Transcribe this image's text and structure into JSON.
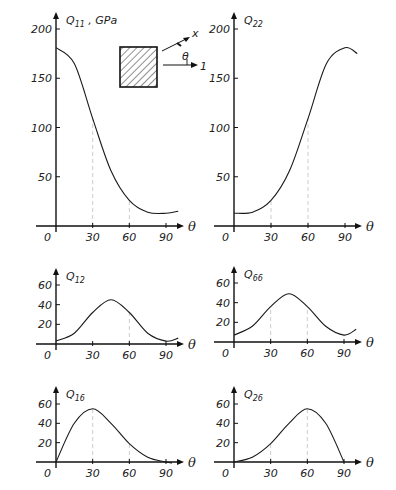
{
  "figure": {
    "inset": {
      "x_axis_label": "x",
      "angle_label": "θ",
      "ref_axis_label": "1"
    }
  },
  "chart_data": [
    {
      "type": "line",
      "id": "q11",
      "title": "Q11 , GPa",
      "title_main": "Q",
      "title_sub": "11",
      "title_suffix": " , GPa",
      "xlabel": "θ",
      "ylabel": "GPa",
      "x": [
        0,
        15,
        30,
        45,
        60,
        75,
        90,
        100
      ],
      "values": [
        181,
        165,
        109,
        56,
        26,
        14,
        13,
        15
      ],
      "xticks": [
        0,
        30,
        60,
        90
      ],
      "yticks": [
        50,
        100,
        150,
        200
      ],
      "xlim": [
        0,
        100
      ],
      "ylim": [
        0,
        210
      ],
      "guides": [
        [
          30,
          109
        ],
        [
          60,
          26
        ]
      ]
    },
    {
      "type": "line",
      "id": "q22",
      "title": "Q22",
      "title_main": "Q",
      "title_sub": "22",
      "title_suffix": "",
      "xlabel": "θ",
      "ylabel": "",
      "x": [
        0,
        15,
        30,
        45,
        60,
        75,
        90,
        100
      ],
      "values": [
        13,
        14,
        26,
        56,
        109,
        165,
        181,
        175
      ],
      "xticks": [
        0,
        30,
        60,
        90
      ],
      "yticks": [
        50,
        100,
        150,
        200
      ],
      "xlim": [
        0,
        100
      ],
      "ylim": [
        0,
        210
      ],
      "guides": [
        [
          30,
          26
        ],
        [
          60,
          109
        ]
      ]
    },
    {
      "type": "line",
      "id": "q12",
      "title": "Q12",
      "title_main": "Q",
      "title_sub": "12",
      "title_suffix": "",
      "xlabel": "θ",
      "ylabel": "",
      "x": [
        0,
        15,
        30,
        45,
        60,
        75,
        90,
        100
      ],
      "values": [
        3,
        11,
        32,
        45,
        32,
        11,
        3,
        6
      ],
      "xticks": [
        0,
        30,
        60,
        90
      ],
      "yticks": [
        20,
        40,
        60
      ],
      "xlim": [
        0,
        100
      ],
      "ylim": [
        0,
        72
      ],
      "guides": [
        [
          60,
          32
        ]
      ]
    },
    {
      "type": "line",
      "id": "q66",
      "title": "Q66",
      "title_main": "Q",
      "title_sub": "66",
      "title_suffix": "",
      "xlabel": "θ",
      "ylabel": "",
      "x": [
        0,
        15,
        30,
        45,
        60,
        75,
        90,
        100
      ],
      "values": [
        7,
        16,
        36,
        49,
        36,
        16,
        7,
        13
      ],
      "xticks": [
        0,
        30,
        60,
        90
      ],
      "yticks": [
        20,
        40,
        60
      ],
      "xlim": [
        0,
        100
      ],
      "ylim": [
        0,
        72
      ],
      "guides": [
        [
          30,
          36
        ],
        [
          60,
          36
        ]
      ]
    },
    {
      "type": "line",
      "id": "q16",
      "title": "Q16",
      "title_main": "Q",
      "title_sub": "16",
      "title_suffix": "",
      "xlabel": "θ",
      "ylabel": "",
      "x": [
        0,
        15,
        30,
        45,
        60,
        75,
        90,
        95
      ],
      "values": [
        0,
        40,
        55,
        40,
        19,
        5,
        0,
        -1
      ],
      "xticks": [
        0,
        30,
        60,
        90
      ],
      "yticks": [
        20,
        40,
        60
      ],
      "xlim": [
        0,
        100
      ],
      "ylim": [
        0,
        72
      ],
      "guides": [
        [
          30,
          55
        ],
        [
          60,
          19
        ]
      ]
    },
    {
      "type": "line",
      "id": "q26",
      "title": "Q26",
      "title_main": "Q",
      "title_sub": "26",
      "title_suffix": "",
      "xlabel": "θ",
      "ylabel": "",
      "x": [
        0,
        15,
        30,
        45,
        60,
        75,
        90
      ],
      "values": [
        0,
        5,
        19,
        40,
        55,
        40,
        0
      ],
      "xticks": [
        0,
        30,
        60,
        90
      ],
      "yticks": [
        20,
        40,
        60
      ],
      "xlim": [
        0,
        100
      ],
      "ylim": [
        0,
        72
      ],
      "guides": [
        [
          30,
          19
        ],
        [
          60,
          55
        ]
      ]
    }
  ]
}
